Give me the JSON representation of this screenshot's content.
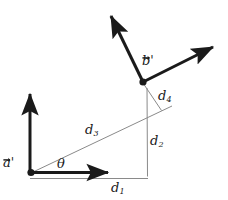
{
  "figure": {
    "background_color": "#ffffff",
    "stroke_color": "#1a1a1a",
    "thin_stroke_color": "#808080",
    "labels": {
      "vector_a": "a",
      "vector_a_prime": "'",
      "vector_b": "b",
      "vector_b_prime": "'",
      "angle_theta": "θ",
      "d1_base": "d",
      "d1_sub": "1",
      "d2_base": "d",
      "d2_sub": "2",
      "d3_base": "d",
      "d3_sub": "3",
      "d4_base": "d",
      "d4_sub": "4"
    },
    "geometry": {
      "origin": {
        "x": 30,
        "y": 173
      },
      "vector_a_up_tip": {
        "x": 30,
        "y": 89
      },
      "vector_a_right_tip": {
        "x": 113,
        "y": 172
      },
      "vertex_b": {
        "x": 143,
        "y": 82
      },
      "vector_b_upleft_tip": {
        "x": 108,
        "y": 11
      },
      "vector_b_upright_tip": {
        "x": 218,
        "y": 44
      },
      "d1_baseline_y": 178,
      "d1_baseline_x_end": 148,
      "d2_line_x": 147,
      "d2_line_y_top": 88,
      "d2_line_y_bottom": 176,
      "d3_line_start": {
        "x": 33,
        "y": 172
      },
      "d3_line_end": {
        "x": 172,
        "y": 106
      },
      "d4_line_start": {
        "x": 143,
        "y": 83
      },
      "d4_line_end": {
        "x": 161,
        "y": 110
      }
    }
  }
}
